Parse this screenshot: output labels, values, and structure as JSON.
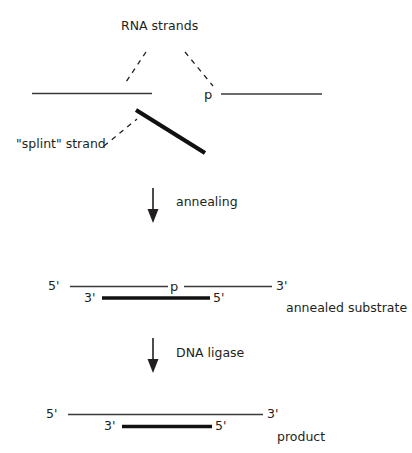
{
  "figure": {
    "title_text": "RNA strands",
    "background_color": "#ffffff",
    "ink_color": "#231f20",
    "labels": {
      "rna_strands": "RNA strands",
      "splint_strand": "\"splint\" strand",
      "phosphate_top": "p",
      "annealing": "annealing",
      "dna_ligase": "DNA ligase",
      "annealed_substrate": "annealed substrate",
      "product": "product",
      "phosphate_substrate": "p"
    },
    "substrate_ends": {
      "top_left": "5'",
      "top_right": "3'",
      "bottom_left": "3'",
      "bottom_right": "5'"
    },
    "product_ends": {
      "top_left": "5'",
      "top_right": "3'",
      "bottom_left": "3'",
      "bottom_right": "5'"
    },
    "steps": [
      {
        "name": "annealing",
        "label": "annealing"
      },
      {
        "name": "ligation",
        "label": "DNA ligase"
      }
    ],
    "stages": [
      {
        "name": "separate-components",
        "caption": ""
      },
      {
        "name": "annealed-substrate",
        "caption": "annealed substrate"
      },
      {
        "name": "ligated-product",
        "caption": "product"
      }
    ]
  }
}
